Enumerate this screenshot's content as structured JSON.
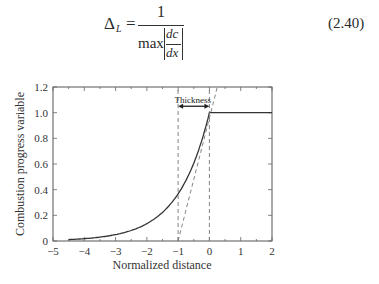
{
  "equation": {
    "lhs_symbol": "Δ",
    "lhs_subscript": "L",
    "equals": "=",
    "numerator": "1",
    "denominator_op": "max",
    "deriv_num": "dc",
    "deriv_den": "dx",
    "number": "(2.40)"
  },
  "chart_data": {
    "type": "line",
    "title": "",
    "xlabel": "Normalized distance",
    "ylabel": "Combustion progress variable",
    "xlim": [
      -5,
      2
    ],
    "ylim": [
      0,
      1.2
    ],
    "x_ticks": [
      -5,
      -4,
      -3,
      -2,
      -1,
      0,
      1,
      2
    ],
    "x_tick_labels": [
      "−5",
      "−4",
      "−3",
      "−2",
      "−1",
      "0",
      "1",
      "2"
    ],
    "y_ticks": [
      0,
      0.2,
      0.4,
      0.6,
      0.8,
      1.0,
      1.2
    ],
    "y_tick_labels": [
      "0",
      "0.2",
      "0.4",
      "0.6",
      "0.8",
      "1.0",
      "1.2"
    ],
    "grid": false,
    "legend": null,
    "series": [
      {
        "name": "progress variable profile",
        "style": "solid",
        "x": [
          -4.5,
          -4.0,
          -3.5,
          -3.0,
          -2.5,
          -2.0,
          -1.5,
          -1.0,
          -0.75,
          -0.5,
          -0.25,
          0.0,
          0.0,
          2.0
        ],
        "y": [
          0.011,
          0.018,
          0.03,
          0.05,
          0.082,
          0.135,
          0.223,
          0.368,
          0.472,
          0.607,
          0.779,
          1.0,
          1.0,
          1.0
        ]
      },
      {
        "name": "max-gradient tangent",
        "style": "dashed",
        "x": [
          -1.0,
          0.25
        ],
        "y": [
          0.0,
          1.25
        ]
      },
      {
        "name": "thickness bound left",
        "style": "dashed",
        "x": [
          -1.0,
          -1.0
        ],
        "y": [
          0.0,
          1.2
        ]
      },
      {
        "name": "thickness bound right",
        "style": "dashed",
        "x": [
          0.0,
          0.0
        ],
        "y": [
          0.0,
          1.2
        ]
      }
    ],
    "annotations": [
      {
        "text": "Thickness",
        "type": "double-arrow",
        "x_from": -1.0,
        "x_to": 0.0,
        "y": 1.05
      }
    ]
  }
}
